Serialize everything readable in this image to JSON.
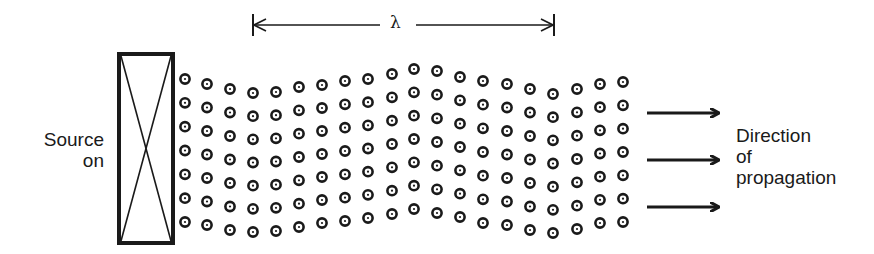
{
  "diagram": {
    "source_label": [
      "Source",
      "on"
    ],
    "direction_label": [
      "Direction",
      "of",
      "propagation"
    ],
    "wavelength_symbol": "λ",
    "wavelength_marker": {
      "x1": 253,
      "x2": 554,
      "y": 25,
      "tick_half": 11
    },
    "source_box": {
      "x": 119,
      "y": 54,
      "width": 54,
      "height": 189,
      "style": "rectangle-with-x"
    },
    "arrows": [
      {
        "x1": 647,
        "x2": 718,
        "y": 113
      },
      {
        "x1": 647,
        "x2": 718,
        "y": 160
      },
      {
        "x1": 647,
        "x2": 718,
        "y": 207
      }
    ],
    "particle_grid": {
      "rows": 7,
      "columns": [
        {
          "x": 185,
          "top": 79,
          "bottom": 222
        },
        {
          "x": 207,
          "top": 84,
          "bottom": 225
        },
        {
          "x": 230,
          "top": 89,
          "bottom": 230
        },
        {
          "x": 253,
          "top": 93,
          "bottom": 232
        },
        {
          "x": 276,
          "top": 92,
          "bottom": 231
        },
        {
          "x": 299,
          "top": 87,
          "bottom": 227
        },
        {
          "x": 322,
          "top": 85,
          "bottom": 223
        },
        {
          "x": 345,
          "top": 81,
          "bottom": 221
        },
        {
          "x": 368,
          "top": 79,
          "bottom": 218
        },
        {
          "x": 392,
          "top": 74,
          "bottom": 214
        },
        {
          "x": 414,
          "top": 69,
          "bottom": 209
        },
        {
          "x": 437,
          "top": 71,
          "bottom": 213
        },
        {
          "x": 460,
          "top": 77,
          "bottom": 217
        },
        {
          "x": 483,
          "top": 81,
          "bottom": 223
        },
        {
          "x": 507,
          "top": 84,
          "bottom": 225
        },
        {
          "x": 530,
          "top": 89,
          "bottom": 230
        },
        {
          "x": 553,
          "top": 94,
          "bottom": 233
        },
        {
          "x": 577,
          "top": 89,
          "bottom": 229
        },
        {
          "x": 600,
          "top": 84,
          "bottom": 223
        },
        {
          "x": 623,
          "top": 82,
          "bottom": 222
        }
      ],
      "particle_symbol": "circled-dot"
    },
    "colors": {
      "ink": "#1a1a1a",
      "background": "#ffffff"
    }
  }
}
